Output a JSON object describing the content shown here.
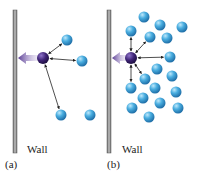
{
  "panels": [
    {
      "id": "a",
      "caption": "(a)",
      "wall_label": "Wall",
      "wall": {
        "x": 13,
        "y": 10,
        "w": 4,
        "h": 143
      },
      "center_particle": {
        "x": 43,
        "y": 58,
        "r": 6
      },
      "particles": [
        {
          "x": 67,
          "y": 40
        },
        {
          "x": 82,
          "y": 61
        },
        {
          "x": 61,
          "y": 115
        },
        {
          "x": 90,
          "y": 115
        }
      ],
      "arrows_to": [
        0,
        1,
        2
      ]
    },
    {
      "id": "b",
      "caption": "(b)",
      "wall_label": "Wall",
      "wall": {
        "x": 107,
        "y": 10,
        "w": 4,
        "h": 143
      },
      "center_particle": {
        "x": 131,
        "y": 58,
        "r": 6
      },
      "particles": [
        {
          "x": 144,
          "y": 17
        },
        {
          "x": 160,
          "y": 25
        },
        {
          "x": 182,
          "y": 27
        },
        {
          "x": 131,
          "y": 31
        },
        {
          "x": 150,
          "y": 37
        },
        {
          "x": 167,
          "y": 38
        },
        {
          "x": 170,
          "y": 57
        },
        {
          "x": 157,
          "y": 69
        },
        {
          "x": 145,
          "y": 79
        },
        {
          "x": 172,
          "y": 76
        },
        {
          "x": 131,
          "y": 88
        },
        {
          "x": 155,
          "y": 88
        },
        {
          "x": 176,
          "y": 92
        },
        {
          "x": 143,
          "y": 98
        },
        {
          "x": 160,
          "y": 103
        },
        {
          "x": 178,
          "y": 108
        },
        {
          "x": 132,
          "y": 108
        },
        {
          "x": 149,
          "y": 117
        }
      ],
      "arrows_to": [
        3,
        4,
        6,
        8,
        10
      ]
    }
  ],
  "colors": {
    "wall": "#8a8a8a",
    "blue_particle": "#3a9fd6",
    "purple_particle": "#3b1f6e",
    "force_arrow": "#6a4ea0",
    "line": "#222222"
  },
  "labels": {
    "a_wall": "Wall",
    "a_caption": "(a)",
    "b_wall": "Wall",
    "b_caption": "(b)"
  }
}
